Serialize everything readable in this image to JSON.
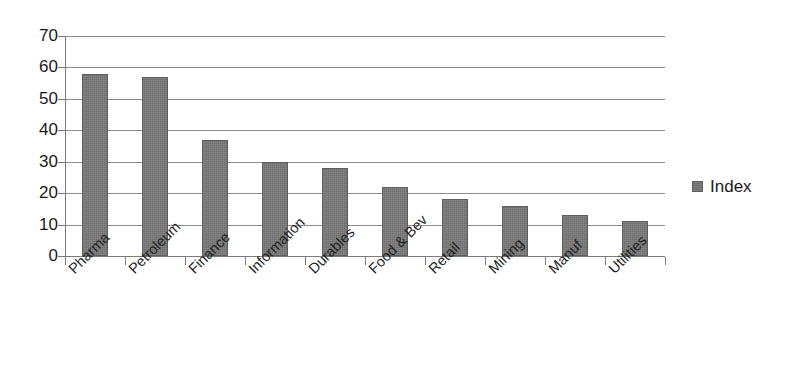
{
  "chart_data": {
    "type": "bar",
    "title": "",
    "subtitle": "",
    "xlabel": "",
    "ylabel": "",
    "ylim": [
      0,
      70
    ],
    "y_ticks": [
      0,
      10,
      20,
      30,
      40,
      50,
      60,
      70
    ],
    "grid": true,
    "legend_position": "right",
    "categories": [
      "Pharma",
      "Petroleum",
      "Finance",
      "Information",
      "Durables",
      "Food & Bev",
      "Retail",
      "Mining",
      "Manuf",
      "Utilities"
    ],
    "series": [
      {
        "name": "Index",
        "values": [
          58,
          57,
          37,
          30,
          28,
          22,
          18,
          16,
          13,
          11
        ],
        "color": "#6d6d6d"
      }
    ]
  },
  "legend": {
    "entries": [
      {
        "label": "Index",
        "marker": "filled-square-marker"
      }
    ]
  },
  "axis": {
    "y_tick_labels": [
      "70",
      "60",
      "50",
      "40",
      "30",
      "20",
      "10",
      "0"
    ]
  },
  "colors": {
    "bar_fill": "#6d6d6d",
    "bar_stroke": "#5f5f5f",
    "gridline": "#8c8c8c",
    "axis_line": "#7b7b7b",
    "text": "#1a1a1a",
    "background": "#ffffff"
  }
}
